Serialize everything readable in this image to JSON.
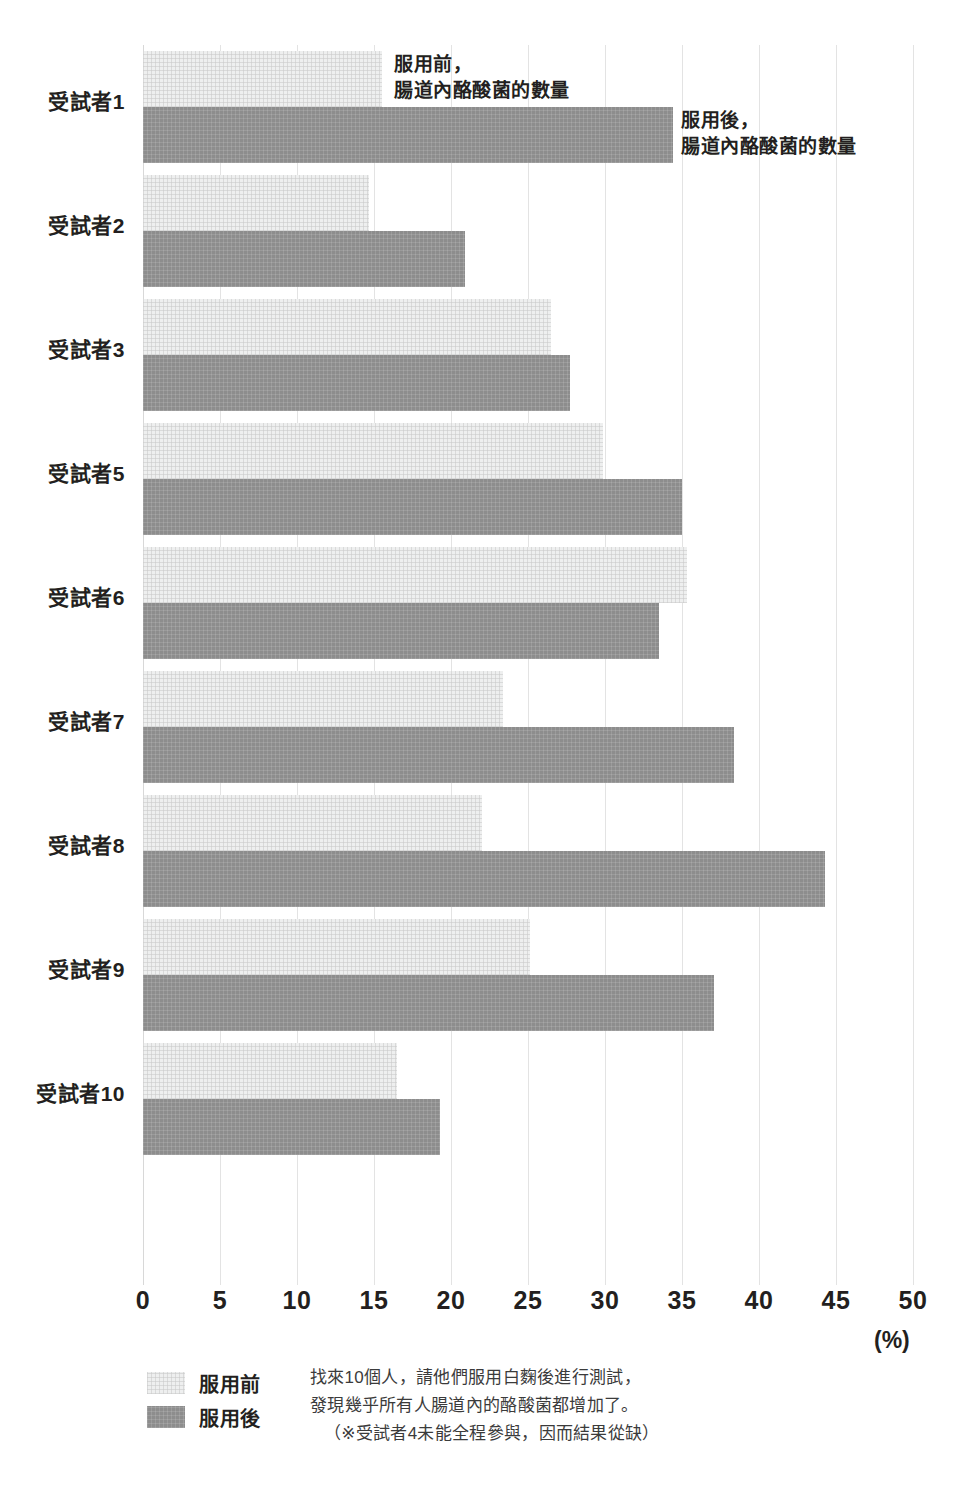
{
  "annotations": {
    "before": "服用前，\n腸道內酪酸菌的數量",
    "after": "服用後，\n腸道內酪酸菌的數量"
  },
  "legend": {
    "before_label": "服用前",
    "after_label": "服用後",
    "before_color": "#eeefef",
    "after_color": "#8d8d8d"
  },
  "axis_unit": "(%)",
  "footnote": {
    "line1": "找來10個人，請他們服用白麴後進行測試，",
    "line2": "發現幾乎所有人腸道內的酪酸菌都增加了。",
    "line3": "（※受試者4未能全程參與，因而結果從缺）"
  },
  "chart_data": {
    "type": "bar",
    "orientation": "horizontal",
    "title": "",
    "xlabel": "(%)",
    "ylabel": "",
    "xlim": [
      0,
      50
    ],
    "xticks": [
      "0",
      "5",
      "10",
      "15",
      "20",
      "25",
      "30",
      "35",
      "40",
      "45",
      "50"
    ],
    "grid": true,
    "legend_position": "bottom-left",
    "categories": [
      "受試者1",
      "受試者2",
      "受試者3",
      "受試者5",
      "受試者6",
      "受試者7",
      "受試者8",
      "受試者9",
      "受試者10"
    ],
    "series": [
      {
        "name": "服用前",
        "color": "#eeefef",
        "values": [
          15.5,
          14.7,
          26.5,
          29.9,
          35.3,
          23.4,
          22.0,
          25.1,
          16.5
        ]
      },
      {
        "name": "服用後",
        "color": "#8d8d8d",
        "values": [
          34.4,
          20.9,
          27.7,
          35.0,
          33.5,
          38.4,
          44.3,
          37.1,
          19.3
        ]
      }
    ]
  }
}
